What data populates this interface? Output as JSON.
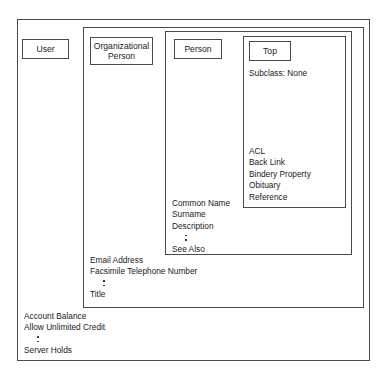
{
  "diagram": {
    "type": "nested-containment",
    "stroke_color": "#4a4a4a",
    "text_color": "#1a1a1a",
    "background": "#ffffff"
  },
  "classes": {
    "user": {
      "label": "User",
      "attributes": {
        "first": "Account Balance",
        "second": "Allow Unlimited Credit",
        "last": "Server Holds"
      }
    },
    "organizational_person": {
      "label_line1": "Organizational",
      "label_line2": "Person",
      "attributes": {
        "first": "Email Address",
        "second": "Facsimile Telephone Number",
        "last": "Title"
      }
    },
    "person": {
      "label": "Person",
      "attributes": {
        "first": "Common Name",
        "second": "Surname",
        "third": "Description",
        "last": "See Also"
      }
    },
    "top": {
      "label": "Top",
      "subclass": "Subclass:  None",
      "attributes": {
        "a1": "ACL",
        "a2": "Back Link",
        "a3": "Bindery Property",
        "a4": "Obituary",
        "a5": "Reference"
      }
    }
  }
}
